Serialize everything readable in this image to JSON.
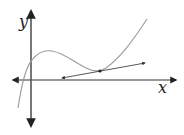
{
  "diagram": {
    "type": "function-graph-with-tangent",
    "axes": {
      "x_label": "x",
      "y_label": "y",
      "color": "#333333"
    },
    "curve": {
      "description": "cubic-like curve with a local max left and local min right; tangent line drawn at a point near the local min",
      "color": "#9a9a9a"
    },
    "tangent_line": {
      "color": "#444444",
      "has_arrowheads": true,
      "point_marked": true
    }
  }
}
